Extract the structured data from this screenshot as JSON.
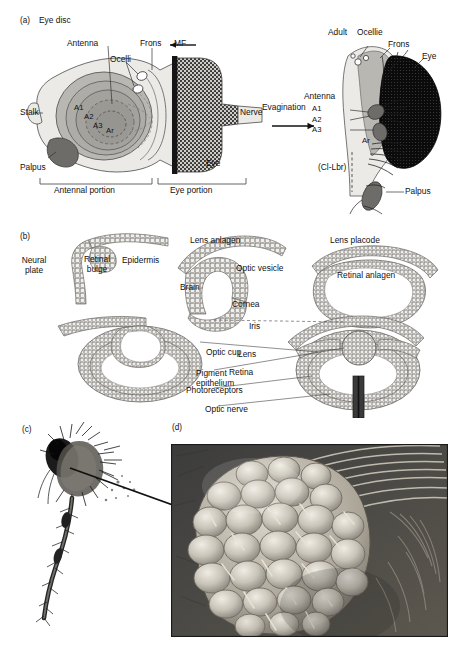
{
  "figure": {
    "kind": "scientific-figure",
    "panels": [
      "a",
      "b",
      "c",
      "d"
    ]
  },
  "panel_a": {
    "tag": "(a)",
    "title": "Eye disc",
    "arrow_label": "Evagination",
    "left_labels": {
      "antenna": "Antenna",
      "ocelli": "Ocelli",
      "frons": "Frons",
      "mf": "MF",
      "stalk": "Stalk",
      "palpus": "Palpus",
      "a1": "A1",
      "a2": "A2",
      "a3": "A3",
      "ar": "Ar",
      "eye": "Eye",
      "nerve": "Nerve",
      "antennal_portion": "Antennal portion",
      "eye_portion": "Eye portion"
    },
    "right_labels": {
      "adult": "Adult",
      "ocellie": "Ocellie",
      "frons": "Frons",
      "eye": "Eye",
      "antenna": "Antenna",
      "a1": "A1",
      "a2": "A2",
      "a3": "A3",
      "ar": "Ar",
      "cl_lbr": "(Cl-Lbr)",
      "palpus": "Palpus"
    }
  },
  "panel_b": {
    "tag": "(b)",
    "stage1": {
      "neural_plate": "Neural\nplate",
      "retinal_bulge": "Retinal\nbulge",
      "epidermis": "Epidermis"
    },
    "stage2": {
      "lens_anlagen": "Lens anlagen",
      "optic_vesicle": "Optic vesicle",
      "brain": "Brain"
    },
    "stage3": {
      "lens_placode": "Lens placode",
      "retinal_anlagen": "Retinal anlagen"
    },
    "stage4": {
      "optic_cup": "Optic cup",
      "pigment_epithelium": "Pigment\nepithelium"
    },
    "stage5": {
      "cornea": "Cornea",
      "iris": "Iris",
      "lens": "Lens",
      "retina": "Retina",
      "photoreceptors": "Photoreceptors",
      "optic_nerve": "Optic nerve"
    }
  },
  "panel_c": {
    "tag": "(c)",
    "caption": ""
  },
  "panel_d": {
    "tag": "(d)",
    "caption": ""
  },
  "colors": {
    "ink": "#111111",
    "disc_pale": "#eceae6",
    "disc_mid": "#b9b7b2",
    "disc_dark": "#8d8b87",
    "palpus": "#6e6c68",
    "furrow": "#151515",
    "eye_black": "#0b0b0b",
    "sem_bg": "#4a4a4a",
    "sem_light": "#d8d4cb"
  }
}
